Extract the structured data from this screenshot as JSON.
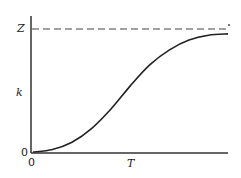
{
  "chart_data": {
    "type": "line",
    "title": "",
    "xlabel": "T",
    "ylabel": "k",
    "x_ticks": [
      "0"
    ],
    "y_ticks": [
      "0",
      "Z"
    ],
    "grid": false,
    "legend": null,
    "asymptote": {
      "label": "Z",
      "style": "dashed",
      "y_normalized": 1.0
    },
    "series": [
      {
        "name": "k(T)",
        "shape": "sigmoid",
        "x_normalized": [
          0,
          0.1,
          0.2,
          0.3,
          0.4,
          0.5,
          0.6,
          0.7,
          0.8,
          0.9,
          1.0
        ],
        "y_normalized": [
          0,
          0.02,
          0.08,
          0.19,
          0.35,
          0.54,
          0.71,
          0.83,
          0.91,
          0.95,
          0.96
        ]
      }
    ],
    "xlim": [
      0,
      1
    ],
    "ylim": [
      0,
      1.0
    ]
  },
  "labels": {
    "y_top": "Z",
    "y_axis": "k",
    "y_zero": "0",
    "x_zero": "0",
    "x_axis": "T"
  }
}
